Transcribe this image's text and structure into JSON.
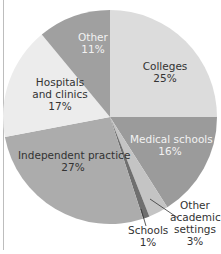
{
  "chart_data": {
    "type": "pie",
    "title": "",
    "slices": [
      {
        "label": "Colleges",
        "value": 25,
        "color": "#dcdcdc"
      },
      {
        "label": "Medical schools",
        "value": 16,
        "color": "#9b9b9b"
      },
      {
        "label": "Other academic settings",
        "value": 3,
        "color": "#c4c4c4"
      },
      {
        "label": "Schools",
        "value": 1,
        "color": "#6f6f6f"
      },
      {
        "label": "Independent practice",
        "value": 27,
        "color": "#acacac"
      },
      {
        "label": "Hospitals and clinics",
        "value": 17,
        "color": "#ececec"
      },
      {
        "label": "Other",
        "value": 11,
        "color": "#a0a0a0"
      }
    ]
  },
  "labels": {
    "colleges": {
      "name": "Colleges",
      "pct": "25%"
    },
    "medical": {
      "name": "Medical schools",
      "pct": "16%"
    },
    "other_academic": {
      "line1": "Other",
      "line2": "academic",
      "line3": "settings",
      "pct": "3%"
    },
    "schools": {
      "name": "Schools",
      "pct": "1%"
    },
    "independent": {
      "name": "Independent practice",
      "pct": "27%"
    },
    "hospitals": {
      "line1": "Hospitals",
      "line2": "and clinics",
      "pct": "17%"
    },
    "other": {
      "name": "Other",
      "pct": "11%"
    }
  }
}
